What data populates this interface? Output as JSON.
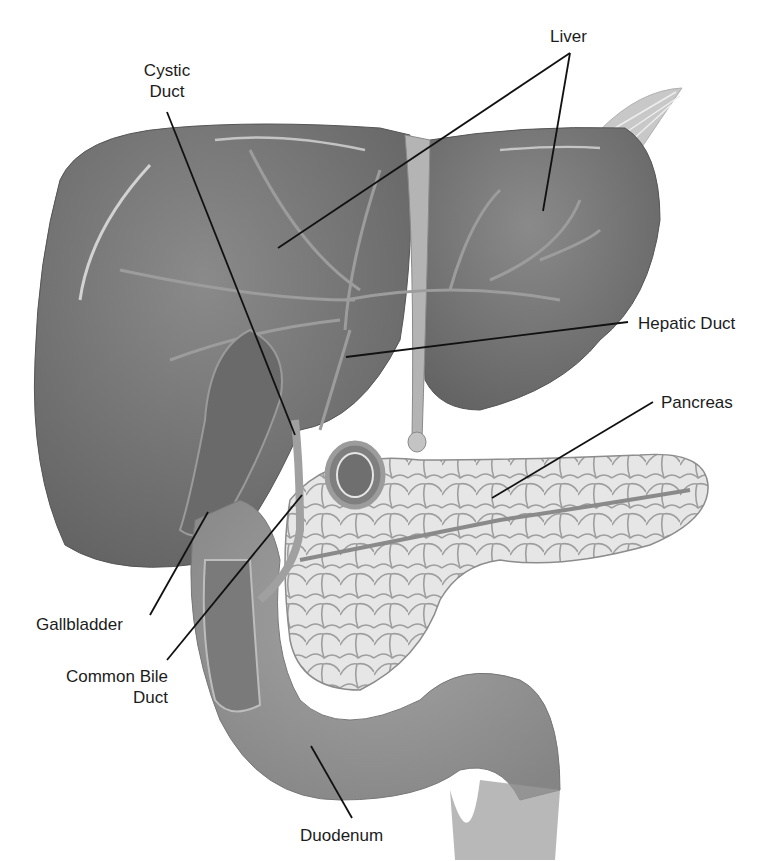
{
  "diagram": {
    "colors": {
      "background": "#ffffff",
      "liver": "#7c7c7c",
      "liver_dark": "#626262",
      "vessels": "#a9a9a9",
      "pancreas": "#e4e4e4",
      "pancreas_lobules": "#9a9a9a",
      "duodenum": "#8e8e8e",
      "leader_lines": "#111111",
      "text": "#1c1c1c"
    },
    "labels": {
      "liver": "Liver",
      "cystic_duct_line1": "Cystic",
      "cystic_duct_line2": "Duct",
      "hepatic_duct": "Hepatic Duct",
      "pancreas": "Pancreas",
      "gallbladder": "Gallbladder",
      "common_bile_duct_line1": "Common Bile",
      "common_bile_duct_line2": "Duct",
      "duodenum": "Duodenum"
    }
  }
}
